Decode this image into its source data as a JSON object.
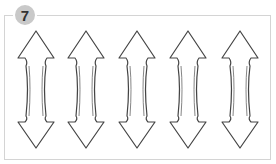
{
  "badge": {
    "number": "7"
  },
  "figure": {
    "arrow_count": 5,
    "arrow_centers_x": [
      36,
      86,
      137,
      188,
      240
    ],
    "stroke_color": "#444444",
    "frame_color": "#d4d4d4",
    "badge_color": "#c9c9c9"
  }
}
